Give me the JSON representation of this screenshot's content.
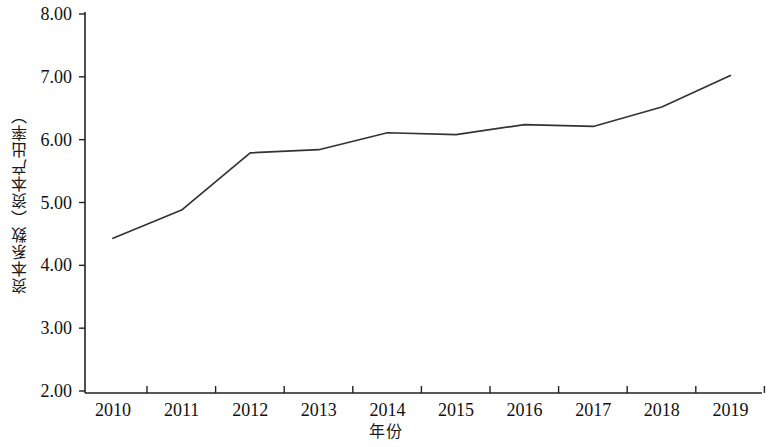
{
  "chart_data": {
    "type": "line",
    "title": "",
    "xlabel": "年份",
    "ylabel": "资本系数（资本产出率）",
    "categories": [
      "2010",
      "2011",
      "2012",
      "2013",
      "2014",
      "2015",
      "2016",
      "2017",
      "2018",
      "2019"
    ],
    "x": [
      2010,
      2011,
      2012,
      2013,
      2014,
      2015,
      2016,
      2017,
      2018,
      2019
    ],
    "values": [
      4.43,
      4.88,
      5.79,
      5.84,
      6.11,
      6.08,
      6.24,
      6.21,
      6.52,
      7.02
    ],
    "series": [
      {
        "name": "资本系数（资本产出率）",
        "values": [
          4.43,
          4.88,
          5.79,
          5.84,
          6.11,
          6.08,
          6.24,
          6.21,
          6.52,
          7.02
        ],
        "color": "#333333"
      }
    ],
    "ylim": [
      2.0,
      8.0
    ],
    "ytick_step": 1.0,
    "ytick_labels": [
      "8.00",
      "7.00",
      "6.00",
      "5.00",
      "4.00",
      "3.00",
      "2.00"
    ],
    "ytick_values": [
      8.0,
      7.0,
      6.0,
      5.0,
      4.0,
      3.0,
      2.0
    ],
    "grid": false,
    "legend": false,
    "legend_position": "none",
    "axis_color": "#222222",
    "line_color": "#333333",
    "background": "#ffffff"
  }
}
